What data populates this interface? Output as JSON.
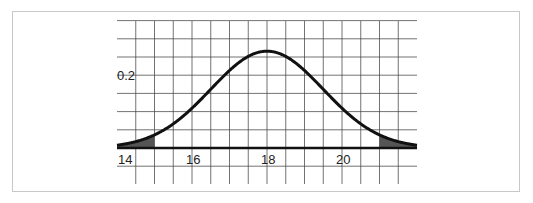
{
  "chart_data": {
    "type": "area",
    "title": "",
    "xlabel": "",
    "ylabel": "",
    "distribution": {
      "mean": 18,
      "sd": 1.5
    },
    "xlim": [
      14,
      22
    ],
    "ylim": [
      -0.1,
      0.35
    ],
    "x_ticks": [
      14,
      16,
      18,
      20
    ],
    "x_tick_labels": [
      "14",
      "16",
      "18",
      "20"
    ],
    "y_ticks": [
      0.2
    ],
    "y_tick_labels": [
      "0.2"
    ],
    "grid": {
      "on": true,
      "x_step": 0.5,
      "y_step": 0.05
    },
    "series": [
      {
        "name": "density",
        "x": [
          14,
          14.5,
          15,
          15.5,
          16,
          16.5,
          17,
          17.5,
          18,
          18.5,
          19,
          19.5,
          20,
          20.5,
          21,
          21.5,
          22
        ],
        "values": [
          0.0076,
          0.018,
          0.036,
          0.0665,
          0.1093,
          0.1613,
          0.213,
          0.2516,
          0.266,
          0.2516,
          0.213,
          0.1613,
          0.1093,
          0.0665,
          0.036,
          0.018,
          0.0076
        ]
      }
    ],
    "shaded_regions": [
      {
        "from": 14,
        "to": 15,
        "label": "lower tail"
      },
      {
        "from": 21,
        "to": 22,
        "label": "upper tail"
      }
    ],
    "colors": {
      "curve": "#111111",
      "shade": "#555555",
      "grid": "#444444",
      "axis": "#111111"
    }
  }
}
